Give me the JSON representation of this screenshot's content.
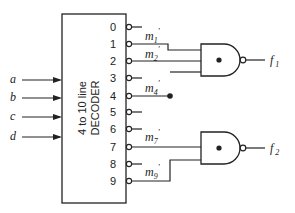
{
  "diagram": {
    "decoder": {
      "label_line1": "4 to 10 line",
      "label_line2": "DECODER",
      "inputs": [
        {
          "name": "a",
          "y": 80
        },
        {
          "name": "b",
          "y": 98
        },
        {
          "name": "c",
          "y": 117
        },
        {
          "name": "d",
          "y": 137
        }
      ],
      "outputs": [
        {
          "index": "0",
          "y": 27
        },
        {
          "index": "1",
          "y": 44
        },
        {
          "index": "2",
          "y": 61
        },
        {
          "index": "3",
          "y": 78
        },
        {
          "index": "4",
          "y": 96
        },
        {
          "index": "5",
          "y": 112
        },
        {
          "index": "6",
          "y": 129
        },
        {
          "index": "7",
          "y": 147
        },
        {
          "index": "8",
          "y": 164
        },
        {
          "index": "9",
          "y": 181
        }
      ]
    },
    "minterm_labels": [
      {
        "text": "m",
        "sub": "1",
        "prime": "′"
      },
      {
        "text": "m",
        "sub": "2",
        "prime": "′"
      },
      {
        "text": "m",
        "sub": "4",
        "prime": "′"
      },
      {
        "text": "m",
        "sub": "7",
        "prime": "′"
      },
      {
        "text": "m",
        "sub": "9",
        "prime": "′"
      }
    ],
    "gates": [
      {
        "type": "NAND",
        "output_label": "f",
        "output_sub": "1",
        "inputs": [
          "m1'",
          "m2'",
          "m4'"
        ]
      },
      {
        "type": "NAND",
        "output_label": "f",
        "output_sub": "2",
        "inputs": [
          "m4'",
          "m7'",
          "m9'"
        ]
      }
    ],
    "colors": {
      "line": "#222222",
      "background": "#ffffff"
    }
  }
}
